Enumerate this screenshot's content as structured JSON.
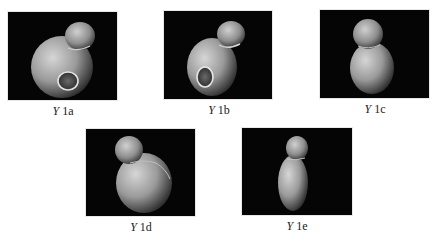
{
  "figure": {
    "panels": [
      {
        "id": "1a",
        "symbol": "Y",
        "suffix": " 1a",
        "description": "specimen with large body, smaller bud at top right, circular aperture at lower front"
      },
      {
        "id": "1b",
        "symbol": "Y",
        "suffix": " 1b",
        "description": "specimen with ovoid body, bud at top right, oval aperture at lower left"
      },
      {
        "id": "1c",
        "symbol": "Y",
        "suffix": " 1c",
        "description": "upright specimen, round bud on top of rounded body"
      },
      {
        "id": "1d",
        "symbol": "Y",
        "suffix": " 1d",
        "description": "specimen with large round body, bud at top left"
      },
      {
        "id": "1e",
        "symbol": "Y",
        "suffix": " 1e",
        "description": "narrow elongated specimen, bud on top of tapering body"
      }
    ],
    "colors": {
      "background": "#ffffff",
      "panel": "#050505",
      "specimen_light": "#c9c9c9",
      "specimen_dark": "#3a3a3a",
      "label": "#222222"
    }
  }
}
